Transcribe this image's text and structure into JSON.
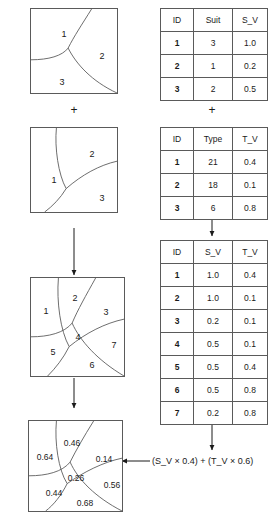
{
  "figure": {
    "operator_plus": "+",
    "formula": "(S_V × 0.4) + (T_V × 0.6)"
  },
  "maps": {
    "suit_map": {
      "name": "suitability-map",
      "regions": [
        {
          "label": "1",
          "x": 34,
          "y": 26
        },
        {
          "label": "2",
          "x": 72,
          "y": 48
        },
        {
          "label": "3",
          "x": 32,
          "y": 74
        }
      ]
    },
    "type_map": {
      "name": "type-map",
      "regions": [
        {
          "label": "1",
          "x": 24,
          "y": 53
        },
        {
          "label": "2",
          "x": 62,
          "y": 27
        },
        {
          "label": "3",
          "x": 72,
          "y": 71
        }
      ]
    },
    "overlay_map": {
      "name": "overlay-map",
      "regions": [
        {
          "label": "1",
          "x": 20,
          "y": 36
        },
        {
          "label": "2",
          "x": 47,
          "y": 22
        },
        {
          "label": "3",
          "x": 78,
          "y": 36
        },
        {
          "label": "4",
          "x": 50,
          "y": 59
        },
        {
          "label": "5",
          "x": 27,
          "y": 74
        },
        {
          "label": "6",
          "x": 64,
          "y": 87
        },
        {
          "label": "7",
          "x": 88,
          "y": 69
        }
      ]
    },
    "result_map": {
      "name": "result-map",
      "regions": [
        {
          "label": "0.64",
          "x": 17,
          "y": 37
        },
        {
          "label": "0.46",
          "x": 44,
          "y": 23
        },
        {
          "label": "0.14",
          "x": 76,
          "y": 39
        },
        {
          "label": "0.26",
          "x": 48,
          "y": 58
        },
        {
          "label": "0.44",
          "x": 26,
          "y": 73
        },
        {
          "label": "0.56",
          "x": 84,
          "y": 65
        },
        {
          "label": "0.68",
          "x": 57,
          "y": 83
        }
      ]
    }
  },
  "tables": {
    "suit_table": {
      "name": "suit-attribute-table",
      "headers": [
        "ID",
        "Suit",
        "S_V"
      ],
      "rows": [
        [
          "1",
          "3",
          "1.0"
        ],
        [
          "2",
          "1",
          "0.2"
        ],
        [
          "3",
          "2",
          "0.5"
        ]
      ]
    },
    "type_table": {
      "name": "type-attribute-table",
      "headers": [
        "ID",
        "Type",
        "T_V"
      ],
      "rows": [
        [
          "1",
          "21",
          "0.4"
        ],
        [
          "2",
          "18",
          "0.1"
        ],
        [
          "3",
          "6",
          "0.8"
        ]
      ]
    },
    "joined_table": {
      "name": "joined-attribute-table",
      "headers": [
        "ID",
        "S_V",
        "T_V"
      ],
      "rows": [
        [
          "1",
          "1.0",
          "0.4"
        ],
        [
          "2",
          "1.0",
          "0.1"
        ],
        [
          "3",
          "0.2",
          "0.1"
        ],
        [
          "4",
          "0.5",
          "0.1"
        ],
        [
          "5",
          "0.5",
          "0.4"
        ],
        [
          "6",
          "0.5",
          "0.8"
        ],
        [
          "7",
          "0.2",
          "0.8"
        ]
      ]
    }
  },
  "colors": {
    "line": "#5a5a5a",
    "text": "#1a1a1a",
    "background": "#ffffff"
  }
}
